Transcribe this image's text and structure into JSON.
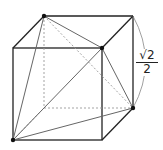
{
  "figure": {
    "label": {
      "numerator": "√2",
      "denominator": "2"
    },
    "cube": {
      "front": {
        "tl": [
          13,
          48
        ],
        "tr": [
          102,
          48
        ],
        "bl": [
          13,
          140
        ],
        "br": [
          102,
          140
        ]
      },
      "back": {
        "tl": [
          44,
          16
        ],
        "tr": [
          133,
          16
        ],
        "bl": [
          44,
          108
        ],
        "br": [
          133,
          108
        ]
      }
    },
    "tetrahedron_vertices": [
      [
        44,
        16
      ],
      [
        102,
        48
      ],
      [
        133,
        108
      ],
      [
        13,
        140
      ]
    ],
    "colors": {
      "edge": "#222222",
      "tetra": "#777777",
      "hidden": "#999999"
    }
  }
}
